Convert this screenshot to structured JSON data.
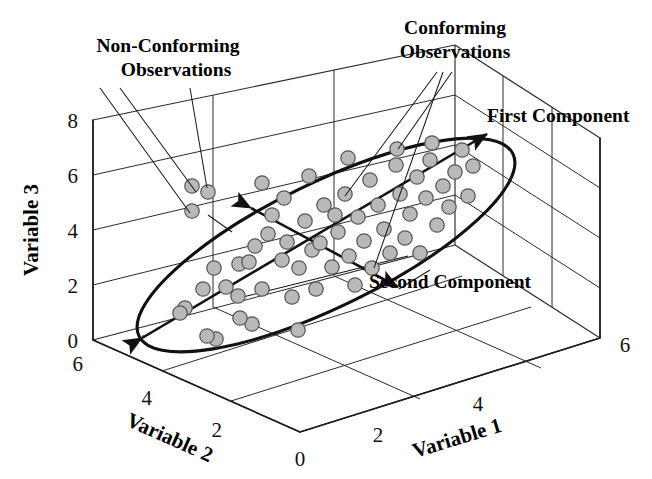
{
  "figure": {
    "type": "3d-scatter-pca",
    "background": "#ffffff",
    "marker_fill": "#b9b9b9",
    "marker_stroke": "#575757",
    "line_color": "#1a1a1a"
  },
  "axes": {
    "x": {
      "name": "Variable 1",
      "ticks": [
        "0",
        "2",
        "4",
        "6"
      ],
      "range": [
        0,
        6
      ]
    },
    "y": {
      "name": "Variable 2",
      "ticks": [
        "0",
        "2",
        "4",
        "6"
      ],
      "range": [
        0,
        6
      ]
    },
    "z": {
      "name": "Variable 3",
      "ticks": [
        "0",
        "2",
        "4",
        "6",
        "8"
      ],
      "range": [
        0,
        8
      ]
    }
  },
  "annotations": [
    {
      "id": "non-conforming",
      "line1": "Non-Conforming",
      "line2": "Observations"
    },
    {
      "id": "conforming",
      "line1": "Conforming",
      "line2": "Observations"
    },
    {
      "id": "first-component",
      "line1": "First Component",
      "line2": ""
    },
    {
      "id": "second-component",
      "line1": "Second Component",
      "line2": ""
    }
  ],
  "chart_data": {
    "type": "scatter",
    "title": "",
    "xlabel": "Variable 1",
    "ylabel": "Variable 2",
    "zlabel": "Variable 3",
    "xlim": [
      0,
      6
    ],
    "ylim": [
      0,
      6
    ],
    "zlim": [
      0,
      8
    ],
    "grid": true,
    "legend": "none",
    "projection": "3d-oblique",
    "series": [
      {
        "name": "Conforming Observations",
        "marker": "circle",
        "fill": "#b9b9b9",
        "stroke": "#575757",
        "points_px": [
          [
            185,
            308
          ],
          [
            203,
            289
          ],
          [
            214,
            268
          ],
          [
            226,
            287
          ],
          [
            239,
            264
          ],
          [
            238,
            296
          ],
          [
            249,
            262
          ],
          [
            255,
            246
          ],
          [
            262,
            289
          ],
          [
            268,
            234
          ],
          [
            272,
            215
          ],
          [
            282,
            260
          ],
          [
            287,
            242
          ],
          [
            292,
            297
          ],
          [
            299,
            268
          ],
          [
            305,
            221
          ],
          [
            312,
            250
          ],
          [
            316,
            289
          ],
          [
            320,
            243
          ],
          [
            324,
            205
          ],
          [
            332,
            267
          ],
          [
            338,
            232
          ],
          [
            345,
            194
          ],
          [
            349,
            256
          ],
          [
            355,
            285
          ],
          [
            358,
            217
          ],
          [
            364,
            241
          ],
          [
            370,
            180
          ],
          [
            372,
            268
          ],
          [
            378,
            205
          ],
          [
            384,
            229
          ],
          [
            390,
            253
          ],
          [
            396,
            165
          ],
          [
            400,
            194
          ],
          [
            405,
            238
          ],
          [
            410,
            214
          ],
          [
            417,
            177
          ],
          [
            420,
            253
          ],
          [
            426,
            198
          ],
          [
            430,
            160
          ],
          [
            437,
            225
          ],
          [
            443,
            186
          ],
          [
            449,
            207
          ],
          [
            455,
            172
          ],
          [
            462,
            150
          ],
          [
            468,
            196
          ],
          [
            473,
            166
          ],
          [
            252,
            324
          ],
          [
            298,
            330
          ],
          [
            216,
            339
          ],
          [
            180,
            313
          ],
          [
            335,
            215
          ],
          [
            309,
            176
          ],
          [
            348,
            158
          ],
          [
            284,
            198
          ],
          [
            262,
            183
          ],
          [
            240,
            318
          ],
          [
            207,
            336
          ],
          [
            432,
            143
          ],
          [
            397,
            149
          ]
        ],
        "count": 60
      },
      {
        "name": "Non-Conforming Observations",
        "marker": "circle",
        "fill": "#b9b9b9",
        "stroke": "#575757",
        "points_px": [
          [
            192,
            186
          ],
          [
            208,
            192
          ],
          [
            192,
            211
          ]
        ],
        "count": 3
      }
    ],
    "components": [
      {
        "name": "First Component",
        "direction": "major-axis",
        "arrow": "both-ends"
      },
      {
        "name": "Second Component",
        "direction": "minor-axis",
        "arrow": "both-ends"
      }
    ],
    "confidence_region": {
      "shape": "ellipse",
      "orientation": "major-axis-along-first-component"
    }
  }
}
